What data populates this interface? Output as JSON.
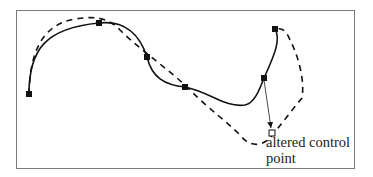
{
  "figure": {
    "title": "",
    "annotation": {
      "line1": "altered control",
      "line2": "point"
    },
    "colors": {
      "frame": "#7a7a7a",
      "curve": "#111111",
      "marker": "#111111",
      "background": "#ffffff"
    },
    "original_curve": {
      "style": "solid",
      "control_points": [
        [
          29,
          94
        ],
        [
          99,
          23
        ],
        [
          147,
          57
        ],
        [
          185,
          87
        ],
        [
          264,
          78
        ],
        [
          275,
          29
        ]
      ]
    },
    "modified_curve": {
      "style": "dashed",
      "description": "curve after moving one control point"
    },
    "altered_control_point": {
      "from": [
        264,
        78
      ],
      "to": [
        272,
        133
      ],
      "marker": "hollow-square"
    }
  }
}
